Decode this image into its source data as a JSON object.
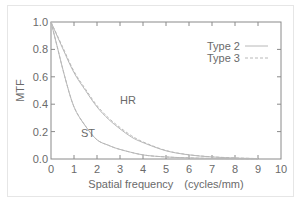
{
  "chart_data": {
    "type": "line",
    "title": "",
    "xlabel": "Spatial frequency　(cycles/mm)",
    "ylabel": "MTF",
    "xlim": [
      0,
      10
    ],
    "ylim": [
      0.0,
      1.0
    ],
    "xticks": [
      "0",
      "1",
      "2",
      "3",
      "4",
      "5",
      "6",
      "7",
      "8",
      "9",
      "10"
    ],
    "yticks": [
      "0.0",
      "0.2",
      "0.4",
      "0.6",
      "0.8",
      "1.0"
    ],
    "grid": false,
    "legend_position": "upper right",
    "legend": [
      {
        "name": "Type 2",
        "style": "solid"
      },
      {
        "name": "Type 3",
        "style": "dashed"
      }
    ],
    "annotations": [
      {
        "text": "HR",
        "x": 3.0,
        "y": 0.43
      },
      {
        "text": "ST",
        "x": 1.3,
        "y": 0.19
      }
    ],
    "series": [
      {
        "name": "HR Type 2",
        "style": "solid",
        "x": [
          0,
          0.5,
          1.0,
          1.5,
          2.0,
          2.5,
          3.0,
          3.5,
          4.0,
          5.0,
          6.0,
          7.0,
          8.0,
          9.0
        ],
        "y": [
          1.0,
          0.81,
          0.63,
          0.5,
          0.38,
          0.29,
          0.22,
          0.16,
          0.12,
          0.06,
          0.03,
          0.015,
          0.007,
          0.003
        ]
      },
      {
        "name": "HR Type 3",
        "style": "dashed",
        "x": [
          0,
          0.5,
          1.0,
          1.5,
          2.0,
          2.5,
          3.0,
          3.5,
          4.0,
          5.0,
          6.0,
          7.0,
          8.0,
          9.0
        ],
        "y": [
          1.0,
          0.82,
          0.64,
          0.51,
          0.39,
          0.3,
          0.23,
          0.17,
          0.125,
          0.062,
          0.031,
          0.016,
          0.008,
          0.003
        ]
      },
      {
        "name": "ST Type 2",
        "style": "solid",
        "x": [
          0,
          0.3,
          0.6,
          1.0,
          1.5,
          2.0,
          2.5,
          3.0,
          4.0,
          5.0,
          6.0,
          7.0,
          8.0,
          9.0
        ],
        "y": [
          1.0,
          0.8,
          0.6,
          0.38,
          0.24,
          0.14,
          0.1,
          0.07,
          0.03,
          0.015,
          0.008,
          0.004,
          0.002,
          0.001
        ]
      },
      {
        "name": "ST Type 3",
        "style": "dashed",
        "x": [
          0,
          0.3,
          0.6,
          1.0,
          1.5,
          2.0,
          2.5,
          3.0,
          4.0,
          5.0,
          6.0,
          7.0,
          8.0,
          9.0
        ],
        "y": [
          1.0,
          0.8,
          0.6,
          0.38,
          0.24,
          0.14,
          0.1,
          0.07,
          0.03,
          0.015,
          0.008,
          0.004,
          0.002,
          0.001
        ]
      }
    ]
  },
  "colors": {
    "axis": "#8a8a8a",
    "curve": "#b8b8b8",
    "text": "#6a6a6a"
  }
}
